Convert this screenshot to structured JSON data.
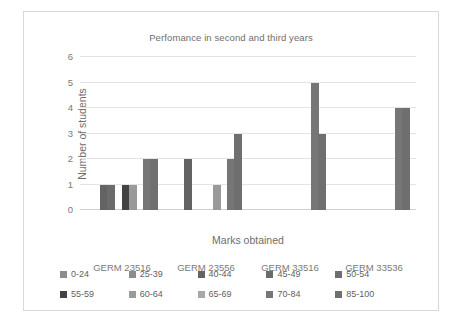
{
  "chart_data": {
    "type": "bar",
    "title": "Perfomance in second and third years",
    "xlabel": "Marks obtained",
    "ylabel": "Number of students",
    "categories": [
      "GERM 23516",
      "GERM 23556",
      "GERM 33516",
      "GERM 33536"
    ],
    "ylim": [
      0,
      6
    ],
    "yticks": [
      "0",
      "1",
      "2",
      "3",
      "4",
      "5",
      "6"
    ],
    "grid": true,
    "legend_position": "bottom",
    "series": [
      {
        "name": "0-24",
        "color": "#8c8c8c",
        "values": [
          0,
          0,
          0,
          0
        ]
      },
      {
        "name": "25-39",
        "color": "#8c8c8c",
        "values": [
          0,
          0,
          0,
          0
        ]
      },
      {
        "name": "40-44",
        "color": "#636363",
        "values": [
          1,
          2,
          0,
          0
        ]
      },
      {
        "name": "45-49",
        "color": "#6b6b6b",
        "values": [
          1,
          0,
          0,
          0
        ]
      },
      {
        "name": "50-54",
        "color": "#6e6e6e",
        "values": [
          0,
          0,
          0,
          0
        ]
      },
      {
        "name": "55-59",
        "color": "#434343",
        "values": [
          1,
          0,
          0,
          0
        ]
      },
      {
        "name": "60-64",
        "color": "#9a9a9a",
        "values": [
          1,
          1,
          0,
          0
        ]
      },
      {
        "name": "65-69",
        "color": "#a8a8a8",
        "values": [
          0,
          0,
          0,
          0
        ]
      },
      {
        "name": "70-84",
        "color": "#767676",
        "values": [
          2,
          2,
          5,
          4
        ]
      },
      {
        "name": "85-100",
        "color": "#6f6f6f",
        "values": [
          2,
          3,
          3,
          4
        ]
      }
    ]
  }
}
